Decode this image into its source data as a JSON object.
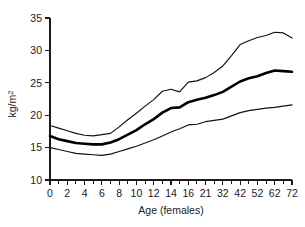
{
  "chart_data": {
    "type": "line",
    "title": "",
    "subtitle": "",
    "xlabel": "Age (females)",
    "ylabel": "kg/m2",
    "ylabel_base": "kg/m",
    "ylabel_exponent": "2",
    "xlim": [
      0,
      14
    ],
    "ylim": [
      10,
      35
    ],
    "grid": false,
    "legend": null,
    "y_ticks": [
      10,
      15,
      20,
      25,
      30,
      35
    ],
    "y_tick_labels": [
      "10",
      "15",
      "20",
      "25",
      "30",
      "35"
    ],
    "x_tick_labels": [
      "0",
      "2",
      "4",
      "6",
      "8",
      "10",
      "12",
      "14",
      "16",
      "21",
      "32",
      "42",
      "52",
      "62",
      "72"
    ],
    "x_minor_ticks_between": 1,
    "x_axis_note": "Category axis: labels unevenly spaced in real age but evenly spaced on the plot",
    "categories": [
      0,
      2,
      4,
      6,
      8,
      10,
      12,
      14,
      16,
      21,
      32,
      42,
      52,
      62,
      72
    ],
    "series": [
      {
        "name": "upper centile",
        "style": "thin",
        "values": [
          18.4,
          17.6,
          16.9,
          17.0,
          18.2,
          20.3,
          22.4,
          24.0,
          25.1,
          27.6,
          30.9,
          32.0,
          32.8,
          32.5,
          31.9
        ]
      },
      {
        "name": "median",
        "style": "bold",
        "values": [
          16.8,
          16.0,
          15.6,
          15.5,
          16.3,
          17.7,
          19.4,
          21.1,
          22.0,
          23.6,
          25.2,
          26.0,
          26.9,
          26.8,
          26.7
        ]
      },
      {
        "name": "lower centile",
        "style": "thin",
        "values": [
          15.0,
          14.4,
          14.0,
          13.8,
          14.4,
          15.2,
          16.2,
          17.4,
          18.5,
          19.4,
          20.4,
          20.9,
          21.2,
          21.5,
          21.6
        ]
      }
    ],
    "series_detailed": {
      "x_positions": [
        0,
        0.5,
        1,
        1.5,
        2,
        2.5,
        3,
        3.5,
        4,
        4.5,
        5,
        5.5,
        6,
        6.5,
        7,
        7.5,
        8,
        8.5,
        9,
        9.5,
        10,
        10.5,
        11,
        11.5,
        12,
        12.5,
        13,
        13.5,
        14
      ],
      "upper": [
        18.4,
        18.0,
        17.6,
        17.2,
        16.9,
        16.8,
        17.0,
        17.2,
        18.2,
        19.3,
        20.3,
        21.4,
        22.4,
        23.7,
        24.0,
        23.6,
        25.1,
        25.3,
        25.8,
        26.6,
        27.6,
        29.2,
        30.9,
        31.5,
        32.0,
        32.3,
        32.8,
        32.7,
        31.9
      ],
      "median": [
        16.8,
        16.3,
        16.0,
        15.7,
        15.6,
        15.5,
        15.5,
        15.8,
        16.3,
        17.0,
        17.7,
        18.6,
        19.4,
        20.4,
        21.1,
        21.2,
        22.0,
        22.4,
        22.7,
        23.1,
        23.6,
        24.4,
        25.2,
        25.7,
        26.0,
        26.5,
        26.9,
        26.8,
        26.7
      ],
      "lower": [
        15.0,
        14.7,
        14.4,
        14.1,
        14.0,
        13.9,
        13.8,
        14.0,
        14.4,
        14.8,
        15.2,
        15.7,
        16.2,
        16.8,
        17.4,
        17.9,
        18.5,
        18.6,
        19.0,
        19.2,
        19.4,
        19.9,
        20.4,
        20.7,
        20.9,
        21.1,
        21.2,
        21.4,
        21.6
      ]
    }
  }
}
